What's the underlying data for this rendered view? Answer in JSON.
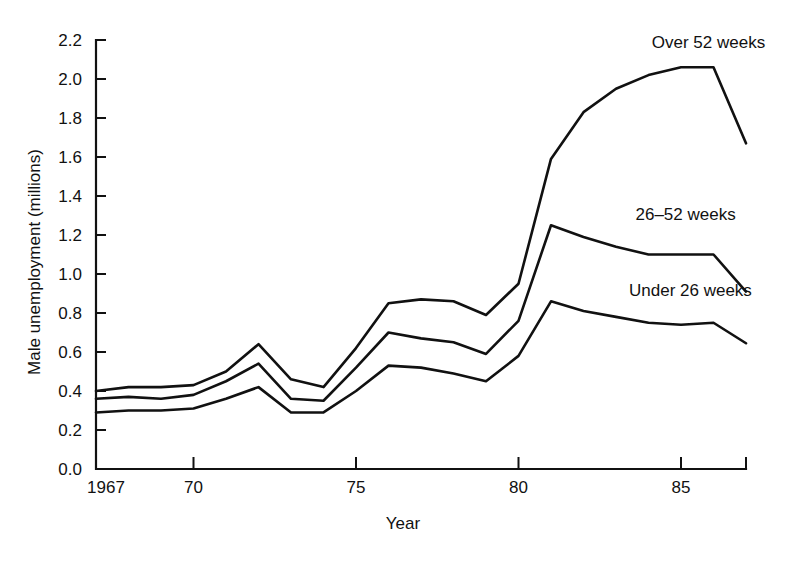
{
  "chart_data": {
    "type": "line",
    "title": "",
    "xlabel": "Year",
    "ylabel": "Male unemployment (millions)",
    "xlim": [
      1967,
      1987
    ],
    "ylim": [
      0.0,
      2.2
    ],
    "grid": false,
    "legend_position": "inline-right",
    "x": [
      1967,
      1968,
      1969,
      1970,
      1971,
      1972,
      1973,
      1974,
      1975,
      1976,
      1977,
      1978,
      1979,
      1980,
      1981,
      1982,
      1983,
      1984,
      1985,
      1986,
      1987
    ],
    "xticks": [
      1967,
      1970,
      1975,
      1980,
      1985
    ],
    "xtick_labels": [
      "1967",
      "70",
      "75",
      "80",
      "85"
    ],
    "yticks": [
      0.0,
      0.2,
      0.4,
      0.6,
      0.8,
      1.0,
      1.2,
      1.4,
      1.6,
      1.8,
      2.0,
      2.2
    ],
    "ytick_labels": [
      "0.0",
      "0.2",
      "0.4",
      "0.6",
      "0.8",
      "1.0",
      "1.2",
      "1.4",
      "1.6",
      "1.8",
      "2.0",
      "2.2"
    ],
    "series": [
      {
        "name": "Over 52 weeks",
        "label": "Over 52 weeks",
        "values": [
          0.4,
          0.42,
          0.42,
          0.43,
          0.5,
          0.64,
          0.46,
          0.42,
          0.62,
          0.85,
          0.87,
          0.86,
          0.79,
          0.95,
          1.59,
          1.83,
          1.95,
          2.02,
          2.06,
          2.06,
          1.67
        ]
      },
      {
        "name": "26-52 weeks",
        "label": "26–52 weeks",
        "values": [
          0.36,
          0.37,
          0.36,
          0.38,
          0.45,
          0.54,
          0.36,
          0.35,
          0.52,
          0.7,
          0.67,
          0.65,
          0.59,
          0.76,
          1.25,
          1.19,
          1.14,
          1.1,
          1.1,
          1.1,
          0.91
        ]
      },
      {
        "name": "Under 26 weeks",
        "label": "Under 26 weeks",
        "values": [
          0.29,
          0.3,
          0.3,
          0.31,
          0.36,
          0.42,
          0.29,
          0.29,
          0.4,
          0.53,
          0.52,
          0.49,
          0.45,
          0.58,
          0.86,
          0.81,
          0.78,
          0.75,
          0.74,
          0.75,
          0.645
        ]
      }
    ],
    "annotations": [
      {
        "text": "Over 52 weeks",
        "x": 1984.1,
        "y": 2.16
      },
      {
        "text": "26–52 weeks",
        "x": 1983.6,
        "y": 1.275
      },
      {
        "text": "Under 26 weeks",
        "x": 1983.4,
        "y": 0.885
      }
    ]
  }
}
